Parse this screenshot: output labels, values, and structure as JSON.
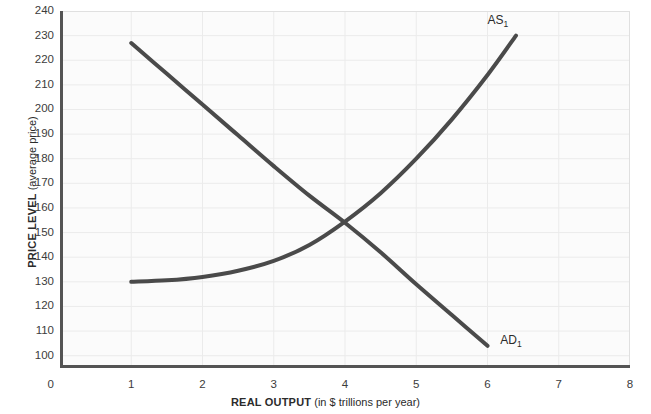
{
  "chart_data": {
    "type": "line",
    "title": "",
    "xlabel_main": "REAL OUTPUT",
    "xlabel_sub": "(in $ trillions per year)",
    "ylabel_main": "PRICE LEVEL",
    "ylabel_sub": "(average price)",
    "xlim": [
      0,
      8
    ],
    "ylim": [
      95,
      240
    ],
    "grid": true,
    "legend_position": "inline-curve-end",
    "x_ticks": [
      "0",
      "1",
      "2",
      "3",
      "4",
      "5",
      "6",
      "7",
      "8"
    ],
    "y_ticks": [
      "100",
      "110",
      "120",
      "130",
      "140",
      "150",
      "160",
      "170",
      "180",
      "190",
      "200",
      "210",
      "220",
      "230",
      "240"
    ],
    "curve_color": "#4a4a4a",
    "axis_color": "#545454",
    "grid_color": "#ebebeb",
    "plot_background": "#fbfbfb",
    "series": [
      {
        "name": "AD1",
        "label_text": "AD",
        "label_sub": "1",
        "label_x": 6.18,
        "label_y": 106,
        "description": "Aggregate demand curve, downward sloping",
        "points": [
          {
            "x": 1.0,
            "y": 227
          },
          {
            "x": 1.5,
            "y": 214.5
          },
          {
            "x": 2.0,
            "y": 202
          },
          {
            "x": 2.5,
            "y": 189.5
          },
          {
            "x": 3.0,
            "y": 177
          },
          {
            "x": 3.5,
            "y": 165
          },
          {
            "x": 4.0,
            "y": 154
          },
          {
            "x": 4.5,
            "y": 142
          },
          {
            "x": 5.0,
            "y": 129
          },
          {
            "x": 5.5,
            "y": 116.5
          },
          {
            "x": 6.0,
            "y": 104
          }
        ]
      },
      {
        "name": "AS1",
        "label_text": "AS",
        "label_sub": "1",
        "label_x": 6.0,
        "label_y": 236,
        "description": "Aggregate supply curve, upward sloping and convex",
        "points": [
          {
            "x": 1.0,
            "y": 130
          },
          {
            "x": 1.5,
            "y": 130.6
          },
          {
            "x": 2.0,
            "y": 132
          },
          {
            "x": 2.5,
            "y": 134.5
          },
          {
            "x": 3.0,
            "y": 138.5
          },
          {
            "x": 3.5,
            "y": 145
          },
          {
            "x": 4.0,
            "y": 154.5
          },
          {
            "x": 4.5,
            "y": 166
          },
          {
            "x": 5.0,
            "y": 180
          },
          {
            "x": 5.5,
            "y": 196
          },
          {
            "x": 6.0,
            "y": 214
          },
          {
            "x": 6.4,
            "y": 230
          }
        ]
      }
    ],
    "equilibrium": {
      "x": 4.0,
      "y": 155
    }
  }
}
